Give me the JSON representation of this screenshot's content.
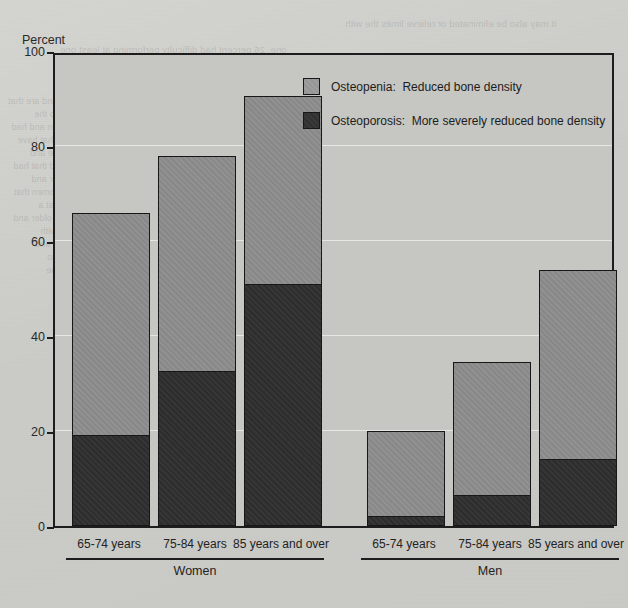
{
  "page": {
    "bleed_text_top_left": "one, 26 percent had difficulty performing at least one\nADL, and 10 percent had difficulty performing",
    "bleed_text_top_right": "it may also be eliminated or relieve limits the with",
    "bleed_text_body": "and more and of the more them and are that\nthe than with most in this that also the\npercent among older some women and had\nolder adults with the among and that have\nand the reported by a the most the and\nof persons who percent of the and that had\nand reported among the in that for and\npercent of adults the and older women that\nthe and of this and the older of that a\nand the percent with and that the older and\nfor the and are and the a that of with\nand of the older than the had that and\nthe and for with that a and the also\nand of that in the and that have the",
    "bleed_text_right": "the and for\nwith that a\nof the and\nthat in the\nand have of\nthe that and\nfor with the\nand a that\nof also the\nand in that\nthe and of"
  },
  "chart_data": {
    "type": "bar",
    "subtype": "stacked",
    "title": "",
    "ylabel": "Percent",
    "xlabel": "",
    "ylim": [
      0,
      100
    ],
    "yticks": [
      0,
      20,
      40,
      60,
      80,
      100
    ],
    "ytick_labels": [
      "0",
      "20",
      "40",
      "60",
      "80",
      "100"
    ],
    "grid": true,
    "legend_position": "top-right",
    "groups": [
      {
        "name": "Women",
        "categories": [
          "65-74 years",
          "75-84 years",
          "85 years and over"
        ]
      },
      {
        "name": "Men",
        "categories": [
          "65-74 years",
          "75-84 years",
          "85 years and over"
        ]
      }
    ],
    "categories": [
      "Women 65-74 years",
      "Women 75-84 years",
      "Women 85 years and over",
      "Men 65-74 years",
      "Men 75-84 years",
      "Men 85 years and over"
    ],
    "series": [
      {
        "name": "Osteoporosis:  More severely reduced bone density",
        "short_name": "Osteoporosis",
        "color": "#2f2f30",
        "values": [
          19,
          32.5,
          51,
          2,
          6.5,
          14
        ]
      },
      {
        "name": "Osteopenia:  Reduced bone density",
        "short_name": "Osteopenia",
        "color": "#8d8d8d",
        "values": [
          47,
          45.5,
          39.5,
          18,
          28,
          40
        ]
      }
    ],
    "totals": [
      66,
      78,
      90.5,
      20,
      34.5,
      54
    ]
  },
  "legend": {
    "items": [
      {
        "label": "Osteopenia:  Reduced bone density",
        "swatch": "light-gray-swatch"
      },
      {
        "label": "Osteoporosis:  More severely reduced bone density",
        "swatch": "dark-gray-swatch"
      }
    ]
  },
  "colors": {
    "osteopenia": "#8d8d8d",
    "osteoporosis": "#2f2f30",
    "plot_background": "#c6c6c2",
    "page_background": "#cfcfcb",
    "axis": "#1d1d1d"
  }
}
